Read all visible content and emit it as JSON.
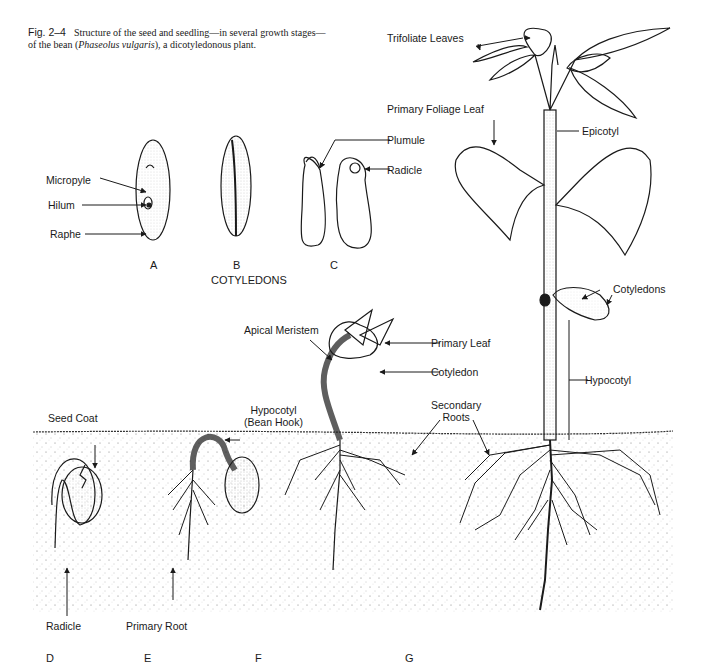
{
  "caption": {
    "figure_number": "Fig. 2–4",
    "text_part1": "Structure of the seed and seedling—in several growth stages—of the bean (",
    "species": "Phaseolus vulgaris",
    "text_part2": "), a dicotyledonous plant."
  },
  "stages": {
    "A": "A",
    "B": "B",
    "C": "C",
    "D": "D",
    "E": "E",
    "F": "F",
    "G": "G",
    "cotyledons_group": "COTYLEDONS"
  },
  "labels": {
    "micropyle": "Micropyle",
    "hilum": "Hilum",
    "raphe": "Raphe",
    "plumule": "Plumule",
    "radicle_c": "Radicle",
    "seed_coat": "Seed Coat",
    "radicle_d": "Radicle",
    "hypocotyl_e_line1": "Hypocotyl",
    "hypocotyl_e_line2": "(Bean Hook)",
    "primary_root": "Primary Root",
    "apical_meristem": "Apical Meristem",
    "primary_leaf": "Primary Leaf",
    "cotyledon_f": "Cotyledon",
    "secondary_roots_line1": "Secondary",
    "secondary_roots_line2": "Roots",
    "trifoliate_leaves": "Trifoliate Leaves",
    "primary_foliage_leaf": "Primary Foliage Leaf",
    "epicotyl": "Epicotyl",
    "cotyledons_g": "Cotyledons",
    "hypocotyl_g": "Hypocotyl"
  },
  "colors": {
    "ink": "#1a1a1a",
    "soil_dots": "#555555",
    "background": "#ffffff"
  }
}
